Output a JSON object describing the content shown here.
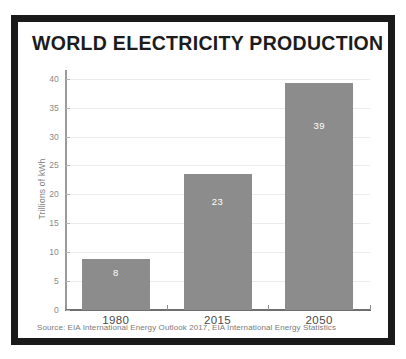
{
  "poster": {
    "title": "WORLD ELECTRICITY PRODUCTION",
    "source_note": "Source: EIA International Energy Outlook 2017, EIA International Energy Statistics",
    "frame_color": "#1a1a1a",
    "background_color": "#ffffff"
  },
  "chart_data": {
    "type": "bar",
    "title": "WORLD ELECTRICITY PRODUCTION",
    "subtitle": "",
    "xlabel": "",
    "ylabel": "Trillions of kWh",
    "categories": [
      "1980",
      "2015",
      "2050"
    ],
    "values": [
      8.9,
      23.5,
      39.2
    ],
    "data_labels": [
      "8",
      "23",
      "39"
    ],
    "ylim": [
      0,
      41.5
    ],
    "yticks": [
      0,
      5,
      10,
      15,
      20,
      25,
      30,
      35,
      40
    ],
    "ytick_labels": [
      "0",
      "5",
      "10",
      "15",
      "20",
      "25",
      "30",
      "35",
      "40"
    ],
    "grid": true,
    "legend": false,
    "legend_position": "none",
    "bar_color": "#8c8c8c",
    "data_label_color": "#ffffff",
    "gridline_color": "#ebebeb",
    "axis_color": "#6e6e6e",
    "annotations": [
      "Source: EIA International Energy Outlook 2017, EIA International Energy Statistics"
    ]
  }
}
